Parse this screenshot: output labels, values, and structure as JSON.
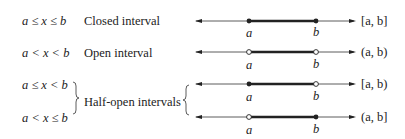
{
  "rows": [
    {
      "inequality": "a ≤ x ≤ b",
      "name": "Closed interval",
      "notation": "[a, b]",
      "left": "closed",
      "right": "closed"
    },
    {
      "inequality": "a < x < b",
      "name": "Open interval",
      "notation": "(a, b)",
      "left": "open",
      "right": "open"
    },
    {
      "inequality": "a ≤ x < b",
      "name": "",
      "notation": "[a, b)",
      "left": "closed",
      "right": "open"
    },
    {
      "inequality": "a < x ≤ b",
      "name": "",
      "notation": "(a, b]",
      "left": "open",
      "right": "closed"
    }
  ],
  "group_label": "Half-open intervals",
  "point_labels": {
    "a": "a",
    "b": "b"
  },
  "colors": {
    "line": "#333333",
    "segment": "#222222"
  }
}
